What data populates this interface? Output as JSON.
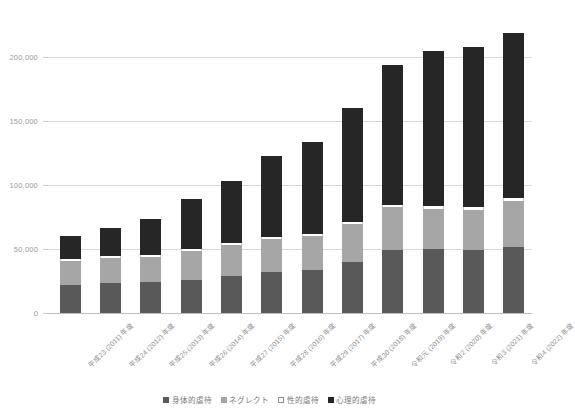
{
  "chart_data": {
    "type": "bar",
    "stacked": true,
    "title": "",
    "xlabel": "",
    "ylabel": "",
    "ylim": [
      0,
      250000
    ],
    "yticks": [
      0,
      50000,
      100000,
      150000,
      200000,
      250000
    ],
    "ytick_labels": [
      "0",
      "50,000",
      "100,000",
      "150,000",
      "200,000",
      "250,000"
    ],
    "grid": true,
    "legend_position": "bottom",
    "categories": [
      "平成23 (2011) 年度",
      "平成24 (2012) 年度",
      "平成25 (2013) 年度",
      "平成26 (2014) 年度",
      "平成27 (2015) 年度",
      "平成28 (2016) 年度",
      "平成29 (2017) 年度",
      "平成30 (2018) 年度",
      "令和元 (2019) 年度",
      "令和2 (2020) 年度",
      "令和3 (2021) 年度",
      "令和4 (2022) 年度"
    ],
    "series": [
      {
        "name": "身体的虐待",
        "color": "#595959",
        "values": [
          21942,
          23579,
          24245,
          26181,
          28621,
          31925,
          33223,
          40238,
          49240,
          50035,
          49241,
          51679
        ]
      },
      {
        "name": "ネグレクト",
        "color": "#a6a6a6",
        "values": [
          18847,
          19250,
          19627,
          22455,
          24444,
          25842,
          26821,
          29479,
          33345,
          31430,
          31448,
          35556
        ]
      },
      {
        "name": "性的虐待",
        "color": "#ffffff",
        "values": [
          1460,
          1449,
          1582,
          1520,
          1521,
          1622,
          1537,
          1730,
          2077,
          2245,
          2247,
          2451
        ]
      },
      {
        "name": "心理的虐待",
        "color": "#262626",
        "values": [
          17670,
          22423,
          28348,
          38775,
          48700,
          63186,
          72197,
          88391,
          109118,
          121334,
          124724,
          129484
        ]
      }
    ],
    "totals": [
      59919,
      66701,
      73802,
      88931,
      103286,
      122575,
      133778,
      159838,
      193780,
      205044,
      207660,
      219170
    ]
  },
  "legend": {
    "items": [
      {
        "label": "身体的虐待",
        "swatch": "swatch-physical"
      },
      {
        "label": "ネグレクト",
        "swatch": "swatch-neglect"
      },
      {
        "label": "性的虐待",
        "swatch": "swatch-sexual"
      },
      {
        "label": "心理的虐待",
        "swatch": "swatch-psychological"
      }
    ]
  }
}
